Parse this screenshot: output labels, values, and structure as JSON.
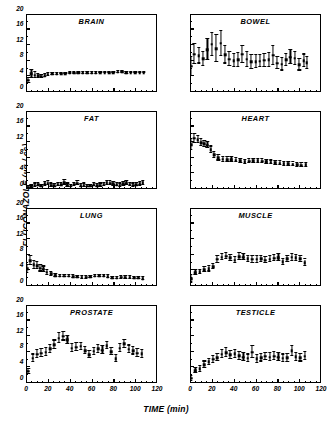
{
  "figure": {
    "ylabel": "FLUCONAZOLE (µg / cc)",
    "xlabel": "TIME (min)"
  },
  "axes": {
    "yticks": [
      0,
      4,
      8,
      12,
      16,
      20
    ],
    "xticks": [
      0,
      20,
      40,
      60,
      80,
      100,
      120
    ],
    "ylim": [
      0,
      20
    ],
    "xlim": [
      0,
      120
    ]
  },
  "chart_data": {
    "type": "scatter",
    "xlabel": "TIME (min)",
    "ylabel": "FLUCONAZOLE (µg / cc)",
    "xlim": [
      0,
      120
    ],
    "ylim": [
      0,
      20
    ],
    "grid": false,
    "legend": "none",
    "error_bars": "symmetric vertical",
    "panel_layout": "4 rows x 2 columns",
    "panels": [
      {
        "name": "BRAIN",
        "row": 1,
        "col": 1,
        "x": [
          2,
          5,
          8,
          11,
          14,
          17,
          20,
          24,
          28,
          32,
          36,
          40,
          44,
          48,
          52,
          56,
          60,
          64,
          68,
          72,
          76,
          80,
          84,
          88,
          92,
          96,
          100,
          104,
          108
        ],
        "y": [
          3.0,
          4.6,
          4.3,
          4.1,
          4.0,
          4.2,
          4.5,
          4.6,
          4.6,
          4.7,
          4.7,
          4.8,
          4.8,
          4.8,
          4.9,
          4.9,
          4.9,
          4.9,
          5.0,
          5.0,
          5.0,
          5.0,
          5.1,
          5.2,
          4.9,
          5.0,
          5.0,
          5.0,
          5.0
        ],
        "yerr": [
          0.6,
          1.0,
          0.8,
          0.5,
          0.4,
          0.3,
          0.3,
          0.2,
          0.2,
          0.2,
          0.2,
          0.2,
          0.2,
          0.2,
          0.2,
          0.2,
          0.2,
          0.2,
          0.2,
          0.2,
          0.2,
          0.2,
          0.2,
          0.2,
          0.2,
          0.2,
          0.2,
          0.2,
          0.2
        ]
      },
      {
        "name": "BOWEL",
        "row": 1,
        "col": 2,
        "x": [
          1,
          4,
          8,
          12,
          16,
          20,
          24,
          28,
          32,
          36,
          40,
          44,
          48,
          52,
          56,
          60,
          64,
          68,
          72,
          76,
          80,
          84,
          88,
          92,
          96,
          100,
          104,
          107
        ],
        "y": [
          6.6,
          9.7,
          9.3,
          8.5,
          10.9,
          12.2,
          11.1,
          12.5,
          9.5,
          8.4,
          8.0,
          8.2,
          9.7,
          8.4,
          7.7,
          7.8,
          7.9,
          8.1,
          8.2,
          9.4,
          7.4,
          7.1,
          8.2,
          8.9,
          8.6,
          7.0,
          8.0,
          7.5
        ],
        "yerr": [
          2.4,
          2.6,
          2.0,
          1.8,
          2.7,
          3.0,
          3.4,
          3.2,
          2.2,
          1.8,
          1.7,
          1.8,
          2.2,
          1.9,
          1.7,
          1.6,
          1.5,
          1.6,
          1.7,
          2.4,
          1.6,
          1.6,
          1.6,
          1.8,
          1.7,
          1.5,
          1.6,
          1.5
        ]
      },
      {
        "name": "FAT",
        "row": 2,
        "col": 1,
        "x": [
          2,
          5,
          8,
          11,
          14,
          17,
          20,
          23,
          26,
          29,
          32,
          35,
          38,
          41,
          44,
          47,
          50,
          53,
          56,
          59,
          62,
          65,
          68,
          71,
          74,
          77,
          80,
          83,
          86,
          89,
          92,
          95,
          98,
          101,
          104,
          107
        ],
        "y": [
          0.4,
          0.6,
          1.0,
          1.1,
          0.8,
          1.3,
          1.5,
          1.0,
          0.9,
          1.2,
          1.1,
          1.6,
          1.0,
          0.8,
          1.2,
          1.5,
          0.9,
          1.0,
          0.7,
          0.8,
          1.1,
          0.9,
          1.0,
          1.2,
          1.6,
          1.5,
          1.4,
          1.1,
          1.0,
          1.3,
          1.5,
          1.2,
          1.0,
          1.1,
          1.3,
          1.6
        ],
        "yerr": [
          0.3,
          0.3,
          0.4,
          0.4,
          0.3,
          0.4,
          0.5,
          0.4,
          0.3,
          0.4,
          0.4,
          0.6,
          0.4,
          0.3,
          0.4,
          0.5,
          0.3,
          0.4,
          0.3,
          0.3,
          0.4,
          0.3,
          0.4,
          0.4,
          0.5,
          0.5,
          0.5,
          0.4,
          0.4,
          0.4,
          0.5,
          0.4,
          0.4,
          0.4,
          0.4,
          0.5
        ]
      },
      {
        "name": "HEART",
        "row": 2,
        "col": 2,
        "x": [
          1,
          4,
          7,
          10,
          13,
          16,
          19,
          22,
          26,
          30,
          34,
          38,
          42,
          46,
          50,
          54,
          58,
          62,
          66,
          70,
          74,
          78,
          82,
          86,
          90,
          94,
          98,
          102,
          106
        ],
        "y": [
          11.4,
          13.0,
          12.6,
          11.9,
          11.6,
          11.2,
          10.1,
          8.7,
          8.0,
          7.6,
          7.5,
          7.5,
          7.4,
          7.2,
          7.0,
          7.1,
          7.2,
          7.2,
          7.1,
          7.0,
          6.8,
          6.7,
          6.6,
          6.5,
          6.4,
          6.3,
          6.2,
          6.1,
          6.2
        ],
        "yerr": [
          1.4,
          1.1,
          0.9,
          0.9,
          0.8,
          0.8,
          0.8,
          0.7,
          0.7,
          0.6,
          0.6,
          0.6,
          0.6,
          0.5,
          0.5,
          0.5,
          0.5,
          0.5,
          0.5,
          0.5,
          0.5,
          0.5,
          0.5,
          0.5,
          0.5,
          0.5,
          0.5,
          0.5,
          0.5
        ]
      },
      {
        "name": "LUNG",
        "row": 3,
        "col": 1,
        "x": [
          1,
          4,
          7,
          10,
          13,
          16,
          19,
          23,
          27,
          31,
          35,
          39,
          43,
          47,
          51,
          55,
          59,
          63,
          67,
          71,
          75,
          79,
          83,
          87,
          91,
          95,
          99,
          103,
          107
        ],
        "y": [
          4.4,
          6.5,
          5.4,
          5.2,
          4.5,
          4.3,
          3.5,
          3.1,
          2.6,
          2.5,
          2.5,
          2.5,
          2.4,
          2.3,
          2.2,
          2.2,
          2.3,
          2.5,
          2.6,
          2.6,
          2.4,
          2.1,
          2.0,
          2.2,
          2.2,
          2.2,
          2.1,
          2.0,
          1.9
        ],
        "yerr": [
          1.0,
          1.1,
          1.0,
          0.9,
          0.8,
          0.7,
          0.6,
          0.5,
          0.4,
          0.3,
          0.3,
          0.3,
          0.3,
          0.3,
          0.3,
          0.3,
          0.3,
          0.3,
          0.3,
          0.3,
          0.3,
          0.3,
          0.3,
          0.3,
          0.3,
          0.3,
          0.3,
          0.3,
          0.3
        ]
      },
      {
        "name": "MUSCLE",
        "row": 3,
        "col": 2,
        "x": [
          1,
          5,
          9,
          13,
          17,
          21,
          25,
          29,
          33,
          37,
          41,
          45,
          49,
          53,
          57,
          61,
          65,
          69,
          73,
          77,
          81,
          85,
          89,
          93,
          97,
          101,
          105
        ],
        "y": [
          1.8,
          3.4,
          3.6,
          4.2,
          4.4,
          5.0,
          6.9,
          7.4,
          7.6,
          7.2,
          6.6,
          7.5,
          7.4,
          7.0,
          6.8,
          6.8,
          7.0,
          6.6,
          6.9,
          7.1,
          7.2,
          6.2,
          7.0,
          7.4,
          7.2,
          7.0,
          6.0
        ],
        "yerr": [
          0.9,
          0.7,
          0.6,
          0.6,
          0.7,
          0.7,
          0.9,
          0.8,
          0.8,
          0.8,
          0.8,
          0.9,
          0.8,
          0.8,
          0.8,
          0.8,
          0.8,
          0.8,
          0.8,
          0.8,
          0.9,
          0.8,
          0.8,
          0.9,
          0.8,
          0.8,
          0.8
        ]
      },
      {
        "name": "PROSTATE",
        "row": 4,
        "col": 1,
        "x": [
          2,
          6,
          10,
          14,
          18,
          22,
          26,
          30,
          34,
          38,
          42,
          46,
          50,
          54,
          58,
          62,
          66,
          70,
          74,
          78,
          82,
          86,
          90,
          94,
          98,
          102,
          106
        ],
        "y": [
          3.0,
          6.3,
          7.4,
          7.6,
          7.9,
          8.7,
          9.8,
          11.5,
          12.0,
          11.1,
          8.9,
          9.2,
          9.4,
          8.3,
          7.2,
          8.1,
          8.7,
          8.4,
          9.6,
          8.0,
          6.2,
          8.9,
          10.0,
          8.6,
          8.3,
          7.6,
          7.5
        ],
        "yerr": [
          0.6,
          1.0,
          1.0,
          1.0,
          1.0,
          1.0,
          1.1,
          1.3,
          1.1,
          1.0,
          1.0,
          1.0,
          0.9,
          0.9,
          0.9,
          0.9,
          1.0,
          1.0,
          0.9,
          0.9,
          0.9,
          1.0,
          1.0,
          1.0,
          1.0,
          1.0,
          1.0
        ]
      },
      {
        "name": "TESTICLE",
        "row": 4,
        "col": 2,
        "x": [
          1,
          5,
          9,
          13,
          17,
          21,
          25,
          29,
          33,
          37,
          41,
          45,
          49,
          53,
          57,
          61,
          65,
          69,
          73,
          77,
          81,
          85,
          89,
          93,
          97,
          101,
          105
        ],
        "y": [
          1.2,
          3.2,
          3.6,
          4.7,
          5.4,
          6.1,
          6.5,
          7.4,
          7.8,
          7.2,
          7.5,
          7.0,
          6.6,
          6.3,
          7.9,
          6.2,
          6.5,
          6.8,
          6.6,
          6.9,
          6.6,
          6.3,
          6.4,
          8.2,
          6.7,
          6.5,
          6.9
        ],
        "yerr": [
          0.6,
          0.7,
          0.7,
          0.8,
          0.8,
          0.9,
          0.9,
          1.0,
          1.2,
          1.0,
          1.0,
          1.0,
          1.0,
          1.0,
          1.5,
          1.0,
          1.0,
          1.0,
          1.0,
          1.0,
          1.0,
          1.0,
          1.0,
          1.3,
          1.0,
          1.0,
          1.0
        ]
      }
    ]
  }
}
